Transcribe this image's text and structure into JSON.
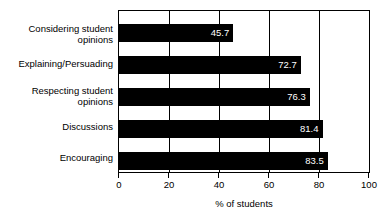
{
  "chart_data": {
    "type": "bar",
    "orientation": "horizontal",
    "title": "",
    "subtitle": "",
    "xlabel": "% of students",
    "ylabel": "",
    "categories": [
      "Considering student\nopinions",
      "Explaining/Persuading",
      "Respecting student\nopinions",
      "Discussions",
      "Encouraging"
    ],
    "values": [
      45.7,
      72.7,
      76.3,
      81.4,
      83.5
    ],
    "value_labels": [
      "45.7",
      "72.7",
      "76.3",
      "81.4",
      "83.5"
    ],
    "xlim": [
      0,
      100
    ],
    "xticks": [
      0,
      20,
      40,
      60,
      80,
      100
    ],
    "xtick_labels": [
      "0",
      "20",
      "40",
      "60",
      "80",
      "100"
    ],
    "grid": true,
    "grid_axis": "x",
    "legend": null,
    "legend_position": "none",
    "bar_color": "#000000",
    "value_label_color": "#ffffff",
    "background_color": "#ffffff",
    "axis_color": "#000000"
  }
}
